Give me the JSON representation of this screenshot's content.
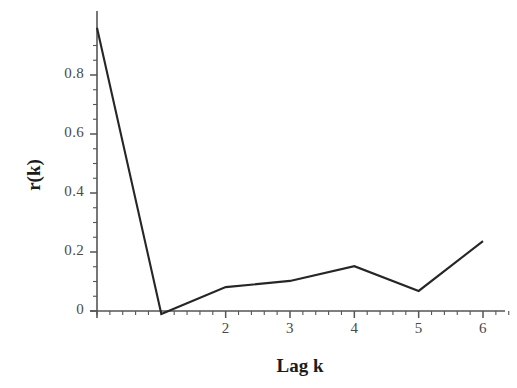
{
  "chart_data": {
    "type": "line",
    "title": "",
    "subtitle": "",
    "xlabel": "Lag k",
    "ylabel": "r(k)",
    "x": [
      0,
      1,
      2,
      3,
      4,
      5,
      6
    ],
    "values": [
      0.96,
      -0.01,
      0.081,
      0.102,
      0.152,
      0.068,
      0.237
    ],
    "series": [
      {
        "name": "r(k)",
        "x": [
          0,
          1,
          2,
          3,
          4,
          5,
          6
        ],
        "values": [
          0.96,
          -0.01,
          0.081,
          0.102,
          0.152,
          0.068,
          0.237
        ]
      }
    ],
    "xlim": [
      -0.25,
      6.45
    ],
    "ylim": [
      -0.03,
      1.0
    ],
    "x_ticks": [
      2,
      3,
      4,
      5,
      6
    ],
    "x_tick_labels": [
      "2",
      "3",
      "4",
      "5",
      "6"
    ],
    "x_minor_tick_interval": 0.2,
    "y_ticks": [
      0,
      0.2,
      0.4,
      0.6,
      0.8
    ],
    "y_tick_labels": [
      "0",
      "0.2",
      "0.4",
      "0.6",
      "0.8"
    ],
    "y_minor_tick_interval": 0.05,
    "grid": false,
    "legend": null,
    "legend_position": "none",
    "line_color": "#262626",
    "axis_color": "#555555",
    "tick_label_color": "#4a4a4a",
    "background_color": "#ffffff",
    "annotations": []
  },
  "axes": {
    "y_tick_labels": [
      {
        "text": "0.8",
        "value": 0.8
      },
      {
        "text": "0.6",
        "value": 0.6
      },
      {
        "text": "0.4",
        "value": 0.4
      },
      {
        "text": "0.2",
        "value": 0.2
      },
      {
        "text": "0",
        "value": 0
      }
    ],
    "x_tick_labels": [
      {
        "text": "2",
        "value": 2
      },
      {
        "text": "3",
        "value": 3
      },
      {
        "text": "4",
        "value": 4
      },
      {
        "text": "5",
        "value": 5
      },
      {
        "text": "6",
        "value": 6
      }
    ],
    "x_axis_title": "Lag k",
    "y_axis_title": "r(k)"
  }
}
